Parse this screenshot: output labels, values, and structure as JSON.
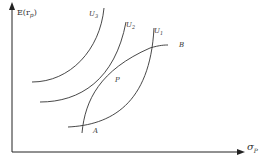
{
  "diagram": {
    "y_axis_label": "E(r",
    "y_axis_sub": "p",
    "y_axis_close": ")",
    "x_axis_label": "σ",
    "x_axis_sub": "P",
    "curves": {
      "u3": {
        "label": "U",
        "sub": "3"
      },
      "u2": {
        "label": "U",
        "sub": "2"
      },
      "u1": {
        "label": "U",
        "sub": "1"
      }
    },
    "point_p": "P",
    "point_a": "A",
    "point_b": "B"
  }
}
